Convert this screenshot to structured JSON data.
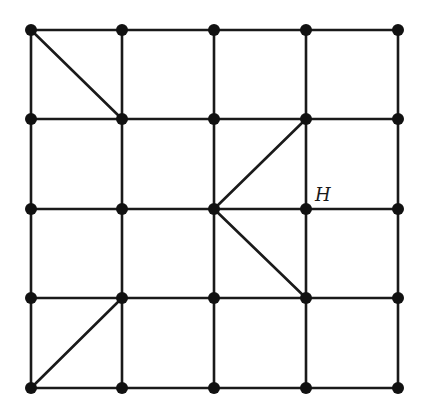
{
  "diagram": {
    "type": "grid-graph",
    "grid": {
      "columns": 5,
      "rows": 5
    },
    "xs": [
      31,
      122,
      214,
      306,
      398
    ],
    "ys": [
      30,
      119,
      209,
      298,
      388
    ],
    "diagonals": [
      {
        "from": [
          0,
          0
        ],
        "to": [
          1,
          1
        ]
      },
      {
        "from": [
          2,
          2
        ],
        "to": [
          3,
          1
        ]
      },
      {
        "from": [
          2,
          2
        ],
        "to": [
          3,
          3
        ]
      },
      {
        "from": [
          0,
          4
        ],
        "to": [
          1,
          3
        ]
      }
    ],
    "labels": [
      {
        "text": "H",
        "node": [
          3,
          2
        ],
        "dx": 9,
        "dy": -8
      }
    ],
    "colors": {
      "line": "#1a1a1a",
      "node": "#111111",
      "background": "#ffffff"
    }
  }
}
